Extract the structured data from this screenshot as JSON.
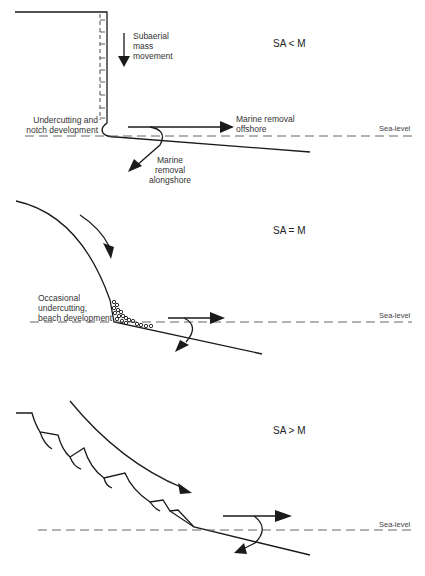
{
  "panels": [
    {
      "condition": "SA < M",
      "labels": {
        "subaerial": [
          "Subaerial",
          "mass",
          "movement"
        ],
        "undercutting": [
          "Undercutting and",
          "notch development"
        ],
        "offshore": [
          "Marine removal",
          "offshore"
        ],
        "alongshore": [
          "Marine",
          "removal",
          "alongshore"
        ],
        "sea_level": "Sea-level"
      }
    },
    {
      "condition": "SA = M",
      "labels": {
        "occasional": [
          "Occasional",
          "undercutting,",
          "beach development"
        ],
        "sea_level": "Sea-level"
      }
    },
    {
      "condition": "SA > M",
      "labels": {
        "sea_level": "Sea-level"
      }
    }
  ],
  "colors": {
    "line": "#1a1a1a",
    "dash": "#555555",
    "background": "#ffffff"
  }
}
